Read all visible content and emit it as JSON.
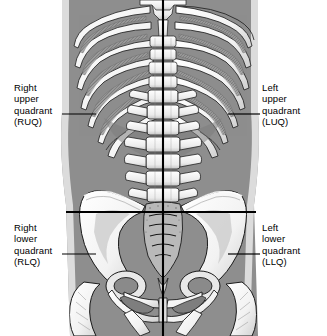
{
  "figure": {
    "background_color": "#ffffff",
    "body_fill_color": "#8e8e8e",
    "body_edge_color": "#d8d8d8",
    "bone_color": "#f7f7f7",
    "bone_outline_color": "#1a1a1a",
    "divider_color": "#000000",
    "text_color": "#000000"
  },
  "labels": {
    "ruq": {
      "line1": "Right",
      "line2": "upper",
      "line3": "quadrant",
      "line4": "(RUQ)",
      "abbreviation": "RUQ",
      "full": "Right upper quadrant"
    },
    "luq": {
      "line1": "Left",
      "line2": "upper",
      "line3": "quadrant",
      "line4": "(LUQ)",
      "abbreviation": "LUQ",
      "full": "Left upper quadrant"
    },
    "rlq": {
      "line1": "Right",
      "line2": "lower",
      "line3": "quadrant",
      "line4": "(RLQ)",
      "abbreviation": "RLQ",
      "full": "Right lower quadrant"
    },
    "llq": {
      "line1": "Left",
      "line2": "lower",
      "line3": "quadrant",
      "line4": "(LLQ)",
      "abbreviation": "LLQ",
      "full": "Left lower quadrant"
    }
  },
  "anatomy": {
    "vertical_divider": "median sagittal line",
    "horizontal_divider": "transumbilical line",
    "structures": [
      "rib cage",
      "costal margin",
      "lumbar vertebral column",
      "sacrum",
      "pelvis",
      "ilium",
      "pubic symphysis",
      "femur head"
    ]
  }
}
